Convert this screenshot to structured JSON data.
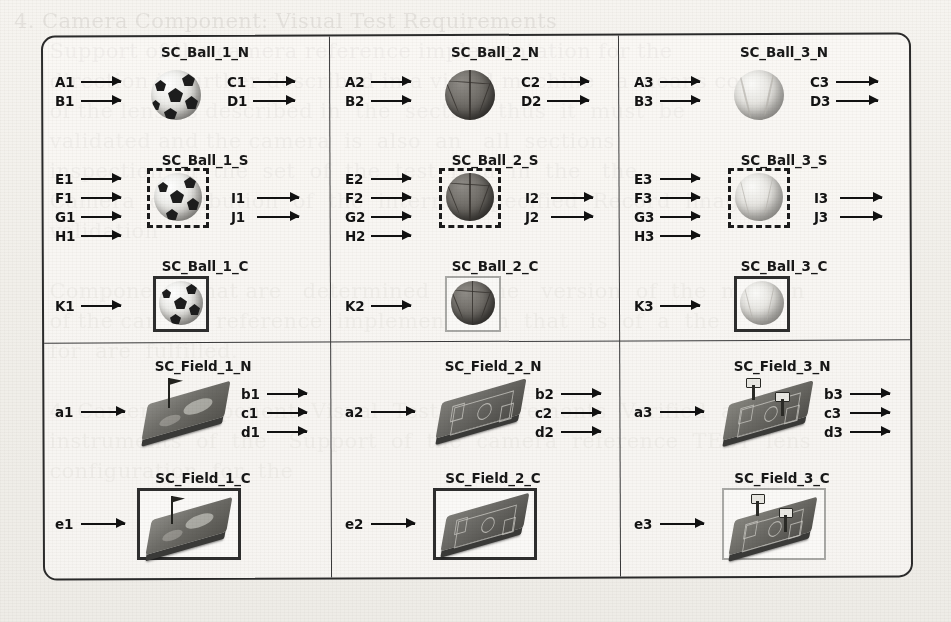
{
  "diagram": {
    "frame_style": "rounded-rectangle",
    "grid": {
      "columns": 3,
      "rows": 2
    }
  },
  "ghost_text": "4. Camera Component: Visual Test Requirements\n     Support of the camera reference implementation for the\n     direction is further described in a visual machine   a means comp\n     of the lens  is described in  the  section  thus  it  must  be\n     validated and the camera  is  also  an   all  sections\n     inspection  of  the  set  of  the  test  is  a  in  the   the\n     Camera  distribution  of  the  internal  specified  Record  image\n     validation\n\n     Components that are   determined  by  the   version  of  the  mission\n     of the camera  reference  implementation  that   is  of  a  the  this\n     for  are  fulfilled.\n\n     4. Camera Component: Visual  Test  Requirements  Verified  all  the\n     instruments  of  the   Support  of  the  camera  reference  TEST  lens\n     configuration  for  the",
  "columns": [
    {
      "id": "col-1",
      "sport": "soccer",
      "ball_blocks": [
        {
          "id": "ball-1-n",
          "label": "SC_Ball_1_N",
          "icon": "soccer-ball-icon",
          "border": "none",
          "inputs": [
            "A1",
            "B1"
          ],
          "outputs": [
            "C1",
            "D1"
          ]
        },
        {
          "id": "ball-1-s",
          "label": "SC_Ball_1_S",
          "icon": "soccer-ball-icon",
          "border": "dashed",
          "inputs": [
            "E1",
            "F1",
            "G1",
            "H1"
          ],
          "outputs": [
            "I1",
            "J1"
          ]
        },
        {
          "id": "ball-1-c",
          "label": "SC_Ball_1_C",
          "icon": "soccer-ball-icon",
          "border": "solid-dark",
          "inputs": [
            "K1"
          ],
          "outputs": []
        }
      ],
      "field_blocks": [
        {
          "id": "field-1-n",
          "label": "SC_Field_1_N",
          "icon": "golf-field-icon",
          "border": "none",
          "inputs": [
            "a1"
          ],
          "outputs": [
            "b1",
            "c1",
            "d1"
          ]
        },
        {
          "id": "field-1-c",
          "label": "SC_Field_1_C",
          "icon": "golf-field-icon",
          "border": "solid-dark",
          "inputs": [
            "e1"
          ],
          "outputs": []
        }
      ]
    },
    {
      "id": "col-2",
      "sport": "basketball",
      "ball_blocks": [
        {
          "id": "ball-2-n",
          "label": "SC_Ball_2_N",
          "icon": "basketball-icon",
          "border": "none",
          "inputs": [
            "A2",
            "B2"
          ],
          "outputs": [
            "C2",
            "D2"
          ]
        },
        {
          "id": "ball-2-s",
          "label": "SC_Ball_2_S",
          "icon": "basketball-icon",
          "border": "dashed",
          "inputs": [
            "E2",
            "F2",
            "G2",
            "H2"
          ],
          "outputs": [
            "I2",
            "J2"
          ]
        },
        {
          "id": "ball-2-c",
          "label": "SC_Ball_2_C",
          "icon": "basketball-icon",
          "border": "solid-light",
          "inputs": [
            "K2"
          ],
          "outputs": []
        }
      ],
      "field_blocks": [
        {
          "id": "field-2-n",
          "label": "SC_Field_2_N",
          "icon": "soccer-field-icon",
          "border": "none",
          "inputs": [
            "a2"
          ],
          "outputs": [
            "b2",
            "c2",
            "d2"
          ]
        },
        {
          "id": "field-2-c",
          "label": "SC_Field_2_C",
          "icon": "soccer-field-icon",
          "border": "solid-dark",
          "inputs": [
            "e2"
          ],
          "outputs": []
        }
      ]
    },
    {
      "id": "col-3",
      "sport": "volleyball",
      "ball_blocks": [
        {
          "id": "ball-3-n",
          "label": "SC_Ball_3_N",
          "icon": "volleyball-icon",
          "border": "none",
          "inputs": [
            "A3",
            "B3"
          ],
          "outputs": [
            "C3",
            "D3"
          ]
        },
        {
          "id": "ball-3-s",
          "label": "SC_Ball_3_S",
          "icon": "volleyball-icon",
          "border": "dashed",
          "inputs": [
            "E3",
            "F3",
            "G3",
            "H3"
          ],
          "outputs": [
            "I3",
            "J3"
          ]
        },
        {
          "id": "ball-3-c",
          "label": "SC_Ball_3_C",
          "icon": "volleyball-icon",
          "border": "solid-dark",
          "inputs": [
            "K3"
          ],
          "outputs": []
        }
      ],
      "field_blocks": [
        {
          "id": "field-3-n",
          "label": "SC_Field_3_N",
          "icon": "basketball-court-icon",
          "border": "none",
          "inputs": [
            "a3"
          ],
          "outputs": [
            "b3",
            "c3",
            "d3"
          ]
        },
        {
          "id": "field-3-c",
          "label": "SC_Field_3_C",
          "icon": "basketball-court-icon",
          "border": "solid-light",
          "inputs": [
            "e3"
          ],
          "outputs": []
        }
      ]
    }
  ]
}
